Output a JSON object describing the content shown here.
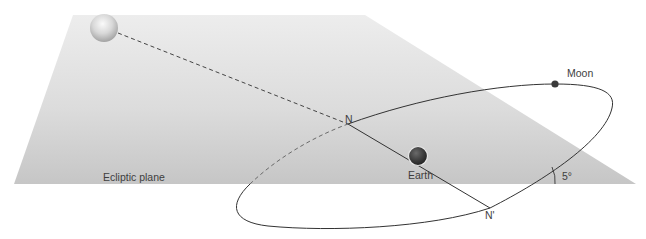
{
  "diagram": {
    "type": "orbital-geometry",
    "labels": {
      "plane": "Ecliptic plane",
      "moon": "Moon",
      "earth": "Earth",
      "node_ascending": "N",
      "node_descending": "N'",
      "inclination": "5°"
    },
    "objects": [
      {
        "name": "Sun",
        "shown_as": "gray sphere, upper left"
      },
      {
        "name": "Earth",
        "shown_as": "dark sphere on line of nodes"
      },
      {
        "name": "Moon",
        "shown_as": "small dark dot on orbit"
      }
    ],
    "colors": {
      "plane_light": "#ececec",
      "plane_dark": "#c4c4c4",
      "line": "#333333",
      "text": "#3e3e3e"
    }
  }
}
